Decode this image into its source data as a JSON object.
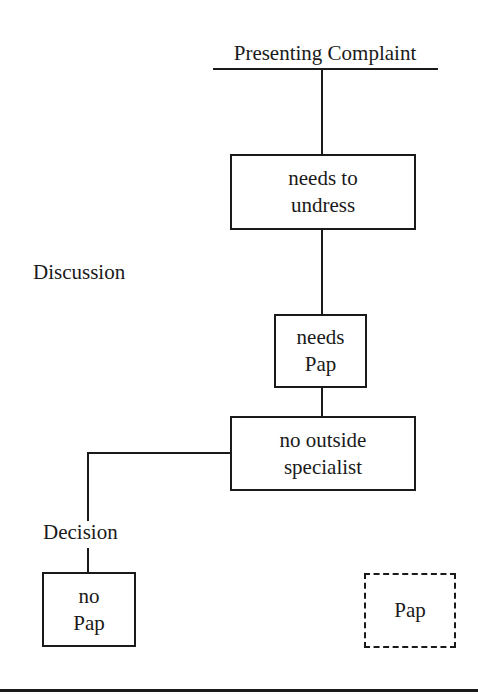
{
  "diagram": {
    "title": "Presenting Complaint",
    "stage_labels": {
      "discussion": "Discussion",
      "decision": "Decision"
    },
    "nodes": [
      {
        "id": "undress",
        "lines": [
          "needs to",
          "undress"
        ],
        "style": "solid"
      },
      {
        "id": "needs_pap",
        "lines": [
          "needs",
          "Pap"
        ],
        "style": "solid"
      },
      {
        "id": "no_specialist",
        "lines": [
          "no outside",
          "specialist"
        ],
        "style": "solid"
      },
      {
        "id": "no_pap",
        "lines": [
          "no",
          "Pap"
        ],
        "style": "solid"
      },
      {
        "id": "pap",
        "lines": [
          "Pap"
        ],
        "style": "dashed"
      }
    ],
    "edges": [
      {
        "from": "title",
        "to": "undress"
      },
      {
        "from": "undress",
        "to": "needs_pap"
      },
      {
        "from": "needs_pap",
        "to": "no_specialist"
      },
      {
        "from": "no_specialist",
        "to": "no_pap"
      }
    ],
    "colors": {
      "ink": "#1a1a1a",
      "background": "#ffffff"
    }
  }
}
